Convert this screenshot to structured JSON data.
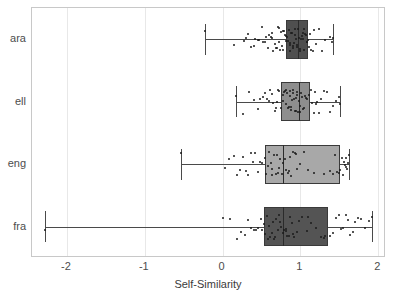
{
  "chart_data": {
    "type": "boxplot",
    "title": "",
    "xlabel": "Self-Similarity",
    "ylabel": "",
    "orientation": "horizontal",
    "xlim": [
      -2.45,
      2.1
    ],
    "ylim": [
      0,
      4
    ],
    "grid": true,
    "legend": "none",
    "xticks": [
      -2,
      -1,
      0,
      1,
      2
    ],
    "xticklabels": [
      "-2",
      "-1",
      "0",
      "1",
      "2"
    ],
    "categories": [
      "ara",
      "ell",
      "eng",
      "fra"
    ],
    "series": [
      {
        "name": "ara",
        "box_color": "#4f4f4f",
        "stats": {
          "whisker_low": -0.22,
          "q1": 0.81,
          "median": 0.97,
          "q3": 1.09,
          "whisker_high": 1.42
        },
        "points": [
          -0.22,
          0.14,
          0.27,
          0.3,
          0.33,
          0.37,
          0.4,
          0.42,
          0.45,
          0.47,
          0.5,
          0.52,
          0.55,
          0.56,
          0.58,
          0.6,
          0.62,
          0.64,
          0.65,
          0.67,
          0.69,
          0.7,
          0.72,
          0.73,
          0.74,
          0.75,
          0.76,
          0.77,
          0.78,
          0.79,
          0.8,
          0.81,
          0.82,
          0.83,
          0.84,
          0.85,
          0.86,
          0.87,
          0.88,
          0.89,
          0.9,
          0.91,
          0.92,
          0.93,
          0.94,
          0.95,
          0.96,
          0.97,
          0.98,
          0.99,
          1.0,
          1.01,
          1.02,
          1.03,
          1.04,
          1.05,
          1.06,
          1.07,
          1.08,
          1.09,
          1.1,
          1.12,
          1.14,
          1.16,
          1.18,
          1.2,
          1.24,
          1.28,
          1.32,
          1.38,
          1.41,
          1.42,
          0.63,
          0.71,
          0.86,
          0.93,
          1.03,
          1.11
        ]
      },
      {
        "name": "ell",
        "box_color": "#8e8e8e",
        "stats": {
          "whisker_low": 0.17,
          "q1": 0.75,
          "median": 0.98,
          "q3": 1.12,
          "whisker_high": 1.51
        },
        "points": [
          0.17,
          0.26,
          0.34,
          0.4,
          0.45,
          0.48,
          0.52,
          0.55,
          0.57,
          0.59,
          0.61,
          0.63,
          0.65,
          0.67,
          0.69,
          0.71,
          0.73,
          0.75,
          0.77,
          0.78,
          0.79,
          0.8,
          0.81,
          0.82,
          0.83,
          0.84,
          0.85,
          0.86,
          0.87,
          0.88,
          0.89,
          0.9,
          0.91,
          0.92,
          0.93,
          0.94,
          0.95,
          0.96,
          0.97,
          0.98,
          0.99,
          1.0,
          1.01,
          1.02,
          1.03,
          1.05,
          1.07,
          1.09,
          1.11,
          1.13,
          1.15,
          1.17,
          1.19,
          1.21,
          1.24,
          1.27,
          1.3,
          1.34,
          1.38,
          1.42,
          1.46,
          1.5,
          1.51,
          0.7,
          0.88,
          0.94,
          1.06,
          1.2
        ]
      },
      {
        "name": "eng",
        "box_color": "#a8a8a8",
        "stats": {
          "whisker_low": -0.53,
          "q1": 0.55,
          "median": 0.77,
          "q3": 1.51,
          "whisker_high": 1.62
        },
        "points": [
          -0.53,
          0.03,
          0.08,
          0.14,
          0.18,
          0.22,
          0.26,
          0.3,
          0.33,
          0.36,
          0.39,
          0.42,
          0.45,
          0.48,
          0.51,
          0.54,
          0.56,
          0.58,
          0.6,
          0.62,
          0.64,
          0.66,
          0.68,
          0.7,
          0.72,
          0.74,
          0.76,
          0.78,
          0.8,
          0.82,
          0.84,
          0.86,
          0.88,
          0.9,
          0.93,
          0.96,
          1.0,
          1.05,
          1.1,
          1.18,
          1.3,
          1.38,
          1.44,
          1.47,
          1.49,
          1.51,
          1.53,
          1.55,
          1.56,
          1.57,
          1.58,
          1.59,
          1.6,
          1.61,
          1.62,
          0.63,
          0.71,
          0.85,
          0.94,
          1.42
        ]
      },
      {
        "name": "fra",
        "box_color": "#545454",
        "stats": {
          "whisker_low": -2.28,
          "q1": 0.53,
          "median": 0.77,
          "q3": 1.35,
          "whisker_high": 1.92
        },
        "points": [
          -2.28,
          0.0,
          0.1,
          0.18,
          0.24,
          0.29,
          0.33,
          0.37,
          0.4,
          0.43,
          0.46,
          0.49,
          0.51,
          0.53,
          0.55,
          0.57,
          0.59,
          0.61,
          0.63,
          0.65,
          0.67,
          0.69,
          0.71,
          0.73,
          0.75,
          0.77,
          0.79,
          0.81,
          0.83,
          0.85,
          0.87,
          0.89,
          0.92,
          0.95,
          0.98,
          1.02,
          1.08,
          1.14,
          1.2,
          1.26,
          1.32,
          1.38,
          1.42,
          1.46,
          1.49,
          1.52,
          1.55,
          1.58,
          1.61,
          1.64,
          1.67,
          1.7,
          1.74,
          1.78,
          1.83,
          1.88,
          1.92,
          0.58,
          0.66,
          0.74,
          0.82,
          0.9,
          1.1,
          1.3
        ]
      }
    ]
  },
  "axis": {
    "x_title": "Self-Similarity"
  }
}
